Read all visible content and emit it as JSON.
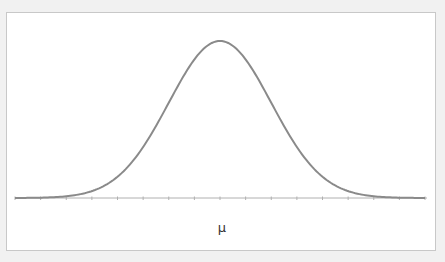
{
  "chart_data": {
    "type": "line",
    "title": "",
    "xlabel": "μ",
    "ylabel": "",
    "x": [
      -4,
      -3.5,
      -3,
      -2.5,
      -2,
      -1.5,
      -1,
      -0.5,
      0,
      0.5,
      1,
      1.5,
      2,
      2.5,
      3,
      3.5,
      4
    ],
    "series": [
      {
        "name": "normal density",
        "values": [
          0.0001,
          0.0009,
          0.0044,
          0.0175,
          0.054,
          0.1295,
          0.242,
          0.3521,
          0.3989,
          0.3521,
          0.242,
          0.1295,
          0.054,
          0.0175,
          0.0044,
          0.0009,
          0.0001
        ]
      }
    ],
    "xlim": [
      -4,
      4
    ],
    "ylim": [
      0,
      0.4
    ],
    "x_tick_count": 17,
    "tick_labels": [],
    "center_label": "μ",
    "grid": false,
    "legend": "none",
    "colors": {
      "line": "#8a8a8a",
      "axis": "#b0b0b0",
      "background": "#ffffff",
      "page": "#f1f1f1"
    }
  }
}
